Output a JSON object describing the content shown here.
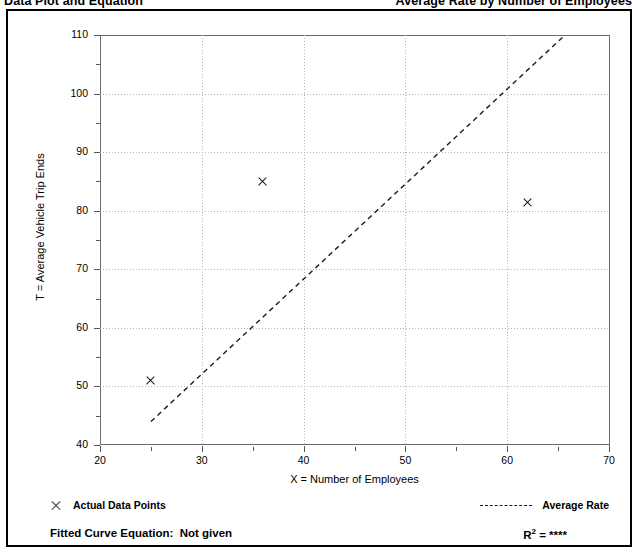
{
  "header": {
    "title_left": "Data Plot and Equation",
    "title_right": "Average Rate by Number of Employees"
  },
  "legend": {
    "data_points_label": "Actual Data Points",
    "average_rate_label": "Average Rate",
    "data_points_marker": "x-marker-icon",
    "average_rate_marker": "dashed-line-icon"
  },
  "footer": {
    "equation_label": "Fitted Curve Equation:  Not given",
    "r2_prefix": "R",
    "r2_exponent": "2",
    "r2_value": "= ****"
  },
  "chart_data": {
    "type": "scatter",
    "title": "Data Plot and Equation",
    "xlabel": "X = Number of Employees",
    "ylabel": "T = Average Vehicle Trip Ends",
    "xlim": [
      20,
      70
    ],
    "ylim": [
      40,
      110
    ],
    "xticks": [
      20,
      30,
      40,
      50,
      60,
      70
    ],
    "xticks_minor": [
      25,
      35,
      45,
      55,
      65
    ],
    "yticks": [
      40,
      50,
      60,
      70,
      80,
      90,
      100,
      110
    ],
    "yticks_minor": [
      45,
      55,
      65,
      75,
      85,
      95,
      105
    ],
    "grid": true,
    "legend_position": "below-plot",
    "series": [
      {
        "name": "Actual Data Points",
        "type": "scatter",
        "marker": "x",
        "points": [
          {
            "x": 25,
            "y": 51
          },
          {
            "x": 36,
            "y": 85
          },
          {
            "x": 62,
            "y": 81.4
          }
        ]
      },
      {
        "name": "Average Rate",
        "type": "line",
        "style": "dashed",
        "points": [
          {
            "x": 25,
            "y": 44
          },
          {
            "x": 70,
            "y": 117
          }
        ]
      }
    ]
  }
}
